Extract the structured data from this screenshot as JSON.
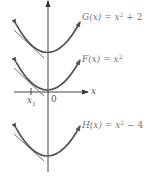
{
  "diagram": {
    "colors": {
      "curve": "#555555",
      "axis": "#444444",
      "tangent": "#666666",
      "label": "#777777"
    },
    "axes": {
      "x_label": "x",
      "origin_label": "0",
      "tick_label_base": "x",
      "tick_label_sub": "1"
    },
    "curves": [
      {
        "name": "G",
        "label_fn": "G(x) = x",
        "label_exp": "2",
        "label_rest": " + 2",
        "vertex_shift": 2
      },
      {
        "name": "F",
        "label_fn": "F(x) = x",
        "label_exp": "2",
        "label_rest": "",
        "vertex_shift": 0
      },
      {
        "name": "H",
        "label_fn": "H(x) = x",
        "label_exp": "2",
        "label_rest": " − 4",
        "vertex_shift": -4
      }
    ]
  }
}
